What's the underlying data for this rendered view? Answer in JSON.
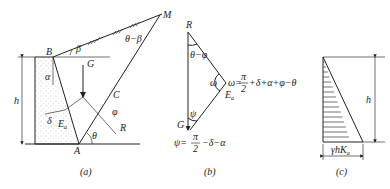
{
  "figure_a": {
    "caption": "(a)",
    "points": {
      "B": "B",
      "M": "M",
      "G": "G",
      "C": "C",
      "A": "A",
      "R": "R"
    },
    "angles": {
      "beta": "β",
      "theta_minus_beta": "θ−β",
      "alpha": "α",
      "delta": "δ",
      "phi": "φ",
      "theta": "θ"
    },
    "force": "E",
    "force_sub": "a",
    "height": "h"
  },
  "figure_b": {
    "caption": "(b)",
    "vertices": {
      "R": "R",
      "G": "G"
    },
    "angle_top": "θ−φ",
    "angle_omega": "ω",
    "omega_eq_prefix": "ω=",
    "omega_eq_frac_num": "π",
    "omega_eq_frac_den": "2",
    "omega_eq_rest": "+δ+α+φ−θ",
    "force": "E",
    "force_sub": "a",
    "angle_psi": "ψ",
    "psi_eq_prefix": "ψ=",
    "psi_eq_frac_num": "π",
    "psi_eq_frac_den": "2",
    "psi_eq_rest": "−δ−α"
  },
  "figure_c": {
    "caption": "(c)",
    "height": "h",
    "base_label": "γhK",
    "base_sub": "a"
  }
}
